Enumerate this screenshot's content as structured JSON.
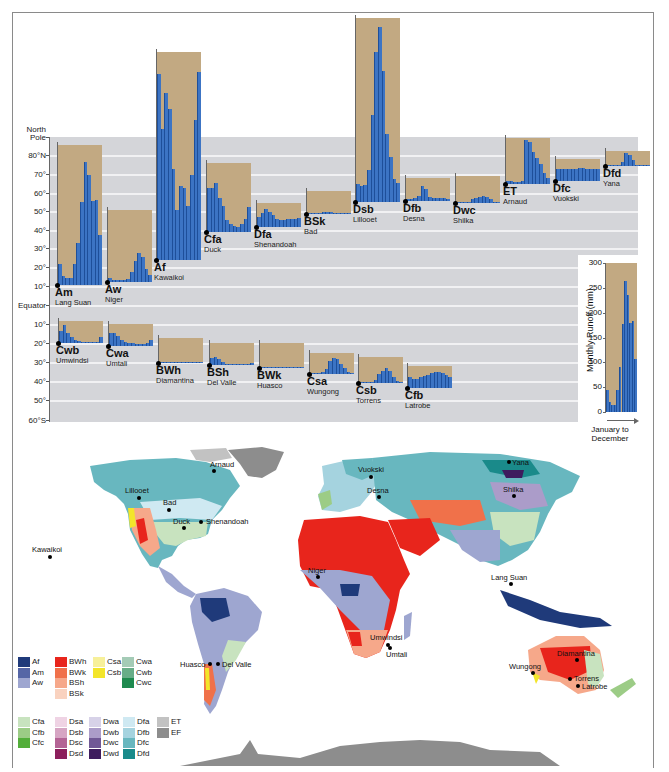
{
  "chart_data": {
    "type": "bar",
    "xlabel": "January to December",
    "ylabel": "Monthly Runoff (mm)",
    "ylim": [
      0,
      300
    ],
    "y_ticks": [
      0,
      50,
      100,
      150,
      200,
      250,
      300
    ],
    "latitude_axis": [
      "North Pole",
      "80°N",
      "70°",
      "60°",
      "50°",
      "40°",
      "30°",
      "20°",
      "10°",
      "Equator",
      "10°",
      "20°",
      "30°",
      "40°",
      "50°",
      "60°S"
    ],
    "categories": [
      "Jan",
      "Feb",
      "Mar",
      "Apr",
      "May",
      "Jun",
      "Jul",
      "Aug",
      "Sep",
      "Oct",
      "Nov",
      "Dec"
    ],
    "series": [
      {
        "name": "Am",
        "station": "Lang Suan",
        "values": [
          45,
          20,
          15,
          14,
          45,
          90,
          178,
          263,
          235,
          180,
          183,
          107
        ]
      },
      {
        "name": "Aw",
        "station": "Niger",
        "values": [
          8,
          5,
          4,
          4,
          4,
          6,
          22,
          46,
          62,
          54,
          28,
          15
        ]
      },
      {
        "name": "Af",
        "station": "Kawaikoi",
        "values": [
          398,
          280,
          357,
          323,
          195,
          107,
          158,
          154,
          116,
          182,
          300,
          402
        ]
      },
      {
        "name": "Cfa",
        "station": "Duck",
        "values": [
          94,
          94,
          105,
          73,
          56,
          26,
          17,
          13,
          11,
          17,
          28,
          54
        ]
      },
      {
        "name": "Dfa",
        "station": "Shenandoah",
        "values": [
          21,
          30,
          38,
          32,
          26,
          17,
          15,
          15,
          17,
          17,
          17,
          19
        ]
      },
      {
        "name": "BSk",
        "station": "Bad",
        "values": [
          1,
          1,
          1,
          2,
          4,
          4,
          4,
          3,
          2,
          1,
          1,
          1
        ]
      },
      {
        "name": "Dsb",
        "station": "Lillooet",
        "values": [
          38,
          35,
          37,
          68,
          186,
          322,
          375,
          280,
          145,
          97,
          50,
          40
        ]
      },
      {
        "name": "Dfb",
        "station": "Desna",
        "values": [
          4,
          4,
          6,
          11,
          32,
          26,
          9,
          6,
          6,
          6,
          6,
          4
        ]
      },
      {
        "name": "Dwc",
        "station": "Shilka",
        "values": [
          2,
          2,
          2,
          2,
          9,
          11,
          13,
          15,
          13,
          9,
          2,
          2
        ]
      },
      {
        "name": "ET",
        "station": "Arnaud",
        "values": [
          6,
          6,
          4,
          4,
          6,
          94,
          90,
          68,
          56,
          43,
          24,
          13
        ]
      },
      {
        "name": "Dfc",
        "station": "Vuokski",
        "values": [
          26,
          25,
          25,
          25,
          26,
          26,
          27,
          27,
          26,
          26,
          26,
          26
        ]
      },
      {
        "name": "Dfd",
        "station": "Yana",
        "values": [
          0,
          0,
          0,
          2,
          9,
          28,
          24,
          13,
          2,
          0,
          0,
          0
        ]
      },
      {
        "name": "Cwb",
        "station": "Umwindsi",
        "values": [
          26,
          39,
          21,
          13,
          6,
          4,
          2,
          2,
          2,
          2,
          2,
          13
        ]
      },
      {
        "name": "Cwa",
        "station": "Umtali",
        "values": [
          28,
          28,
          21,
          13,
          9,
          6,
          6,
          4,
          4,
          4,
          6,
          13
        ]
      },
      {
        "name": "BWh",
        "station": "Diamantina",
        "values": [
          0,
          2,
          2,
          2,
          1,
          0,
          0,
          0,
          0,
          0,
          0,
          0
        ]
      },
      {
        "name": "BSh",
        "station": "Del Valle",
        "values": [
          15,
          17,
          13,
          6,
          2,
          2,
          2,
          2,
          1,
          1,
          2,
          4
        ]
      },
      {
        "name": "BWk",
        "station": "Huasco",
        "values": [
          0,
          0,
          0,
          0,
          1,
          1,
          1,
          1,
          1,
          1,
          1,
          1
        ]
      },
      {
        "name": "Csa",
        "station": "Wungong",
        "values": [
          2,
          2,
          2,
          4,
          11,
          28,
          34,
          32,
          21,
          13,
          4,
          2
        ]
      },
      {
        "name": "Csb",
        "station": "Torrens",
        "values": [
          2,
          2,
          2,
          2,
          6,
          19,
          26,
          32,
          26,
          13,
          4,
          2
        ]
      },
      {
        "name": "Cfb",
        "station": "Latrobe",
        "values": [
          24,
          19,
          19,
          24,
          26,
          28,
          32,
          34,
          34,
          32,
          28,
          24
        ]
      }
    ],
    "legend_position": "bottom-left",
    "grid": true
  },
  "charts": [
    {
      "code": "Am",
      "station": "Lang Suan",
      "x": 58,
      "base": 285,
      "box": 300,
      "values": [
        45,
        20,
        15,
        14,
        45,
        90,
        178,
        263,
        235,
        180,
        183,
        107
      ]
    },
    {
      "code": "Aw",
      "station": "Niger",
      "x": 108,
      "base": 282,
      "box": 155,
      "values": [
        8,
        5,
        4,
        4,
        4,
        6,
        22,
        46,
        62,
        54,
        28,
        15
      ]
    },
    {
      "code": "Af",
      "station": "Kawaikoi",
      "x": 157,
      "base": 260,
      "box": 445,
      "values": [
        398,
        280,
        357,
        323,
        195,
        107,
        158,
        154,
        116,
        182,
        300,
        402
      ]
    },
    {
      "code": "Cfa",
      "station": "Duck",
      "x": 207,
      "base": 232,
      "box": 148,
      "values": [
        94,
        94,
        105,
        73,
        56,
        26,
        17,
        13,
        11,
        17,
        28,
        54
      ]
    },
    {
      "code": "Dfa",
      "station": "Shenandoah",
      "x": 257,
      "base": 227,
      "box": 51,
      "values": [
        21,
        30,
        38,
        32,
        26,
        17,
        15,
        15,
        17,
        17,
        17,
        19
      ]
    },
    {
      "code": "BSk",
      "station": "Bad",
      "x": 307,
      "base": 214,
      "box": 50,
      "values": [
        1,
        1,
        1,
        2,
        4,
        4,
        4,
        3,
        2,
        1,
        1,
        1
      ]
    },
    {
      "code": "Dsb",
      "station": "Lillooet",
      "x": 356,
      "base": 202,
      "box": 395,
      "values": [
        38,
        35,
        37,
        68,
        186,
        322,
        375,
        280,
        145,
        97,
        50,
        40
      ]
    },
    {
      "code": "Dfb",
      "station": "Desna",
      "x": 406,
      "base": 201,
      "box": 50,
      "values": [
        4,
        4,
        6,
        11,
        32,
        26,
        9,
        6,
        6,
        6,
        6,
        4
      ]
    },
    {
      "code": "Dwc",
      "station": "Shilka",
      "x": 456,
      "base": 203,
      "box": 58,
      "values": [
        2,
        2,
        2,
        2,
        9,
        11,
        13,
        15,
        13,
        9,
        2,
        2
      ]
    },
    {
      "code": "ET",
      "station": "Arnaud",
      "x": 506,
      "base": 184,
      "box": 98,
      "values": [
        6,
        6,
        4,
        4,
        6,
        94,
        90,
        68,
        56,
        43,
        24,
        13
      ]
    },
    {
      "code": "Dfc",
      "station": "Vuokski",
      "x": 556,
      "base": 181,
      "box": 47,
      "values": [
        26,
        25,
        25,
        25,
        26,
        26,
        27,
        27,
        26,
        26,
        26,
        26
      ]
    },
    {
      "code": "Dfd",
      "station": "Yana",
      "x": 606,
      "base": 166,
      "box": 32,
      "values": [
        0,
        0,
        0,
        2,
        9,
        28,
        24,
        13,
        2,
        0,
        0,
        0
      ]
    },
    {
      "code": "Cwb",
      "station": "Umwindsi",
      "x": 59,
      "base": 343,
      "box": 47,
      "values": [
        26,
        39,
        21,
        13,
        6,
        4,
        2,
        2,
        2,
        2,
        2,
        13
      ]
    },
    {
      "code": "Cwa",
      "station": "Umtali",
      "x": 109,
      "base": 346,
      "box": 47,
      "values": [
        28,
        28,
        21,
        13,
        9,
        6,
        6,
        4,
        4,
        4,
        6,
        13
      ]
    },
    {
      "code": "BWh",
      "station": "Diamantina",
      "x": 159,
      "base": 363,
      "box": 54,
      "values": [
        0,
        2,
        2,
        2,
        1,
        0,
        0,
        0,
        0,
        0,
        0,
        0
      ]
    },
    {
      "code": "BSh",
      "station": "Del Valle",
      "x": 210,
      "base": 365,
      "box": 47,
      "values": [
        15,
        17,
        13,
        6,
        2,
        2,
        2,
        2,
        1,
        1,
        2,
        4
      ]
    },
    {
      "code": "BWk",
      "station": "Huasco",
      "x": 260,
      "base": 368,
      "box": 54,
      "values": [
        0,
        0,
        0,
        0,
        1,
        1,
        1,
        1,
        1,
        1,
        1,
        1
      ]
    },
    {
      "code": "Csa",
      "station": "Wungong",
      "x": 310,
      "base": 374,
      "box": 45,
      "values": [
        2,
        2,
        2,
        4,
        11,
        28,
        34,
        32,
        21,
        13,
        4,
        2
      ]
    },
    {
      "code": "Csb",
      "station": "Torrens",
      "x": 359,
      "base": 383,
      "box": 56,
      "values": [
        2,
        2,
        2,
        2,
        6,
        19,
        26,
        32,
        26,
        13,
        4,
        2
      ]
    },
    {
      "code": "Cfb",
      "station": "Latrobe",
      "x": 408,
      "base": 388,
      "box": 47,
      "values": [
        24,
        19,
        19,
        24,
        26,
        28,
        32,
        34,
        34,
        32,
        28,
        24
      ]
    }
  ],
  "latitude": [
    {
      "label": "North",
      "y": 129
    },
    {
      "label": "Pole",
      "y": 137
    },
    {
      "label": "80°N",
      "y": 155
    },
    {
      "label": "70°",
      "y": 174
    },
    {
      "label": "60°",
      "y": 193
    },
    {
      "label": "50°",
      "y": 211
    },
    {
      "label": "40°",
      "y": 230
    },
    {
      "label": "30°",
      "y": 248
    },
    {
      "label": "20°",
      "y": 267
    },
    {
      "label": "10°",
      "y": 286
    },
    {
      "label": "Equator",
      "y": 305
    },
    {
      "label": "10°",
      "y": 324
    },
    {
      "label": "20°",
      "y": 343
    },
    {
      "label": "30°",
      "y": 362
    },
    {
      "label": "40°",
      "y": 381
    },
    {
      "label": "50°",
      "y": 400
    },
    {
      "label": "60°S",
      "y": 420
    }
  ],
  "scale": {
    "title": "Monthly Runoff (mm)",
    "ticks": [
      "300",
      "250",
      "200",
      "150",
      "100",
      "50",
      "0"
    ],
    "caption_line1": "January to",
    "caption_line2": "December",
    "values": [
      45,
      20,
      15,
      14,
      45,
      90,
      178,
      263,
      235,
      180,
      183,
      107
    ]
  },
  "legend": {
    "groups": [
      {
        "x": 18,
        "y": 657,
        "items": [
          {
            "label": "Af",
            "color": "#1f3a7a"
          },
          {
            "label": "Am",
            "color": "#5566a6"
          },
          {
            "label": "Aw",
            "color": "#9ea6d0"
          }
        ]
      },
      {
        "x": 55,
        "y": 657,
        "items": [
          {
            "label": "BWh",
            "color": "#e8251c"
          },
          {
            "label": "BWk",
            "color": "#f0714a"
          },
          {
            "label": "BSh",
            "color": "#f6a88a"
          },
          {
            "label": "BSk",
            "color": "#f9d2bf"
          }
        ]
      },
      {
        "x": 93,
        "y": 657,
        "items": [
          {
            "label": "Csa",
            "color": "#f7f09a"
          },
          {
            "label": "Csb",
            "color": "#f3e52a"
          }
        ]
      },
      {
        "x": 122,
        "y": 657,
        "items": [
          {
            "label": "Cwa",
            "color": "#a4cbb6"
          },
          {
            "label": "Cwb",
            "color": "#68ad88"
          },
          {
            "label": "Cwc",
            "color": "#1f8a4f"
          }
        ]
      },
      {
        "x": 18,
        "y": 717,
        "items": [
          {
            "label": "Cfa",
            "color": "#c8e3bf"
          },
          {
            "label": "Cfb",
            "color": "#9ccc86"
          },
          {
            "label": "Cfc",
            "color": "#53ae3a"
          }
        ]
      },
      {
        "x": 55,
        "y": 717,
        "items": [
          {
            "label": "Dsa",
            "color": "#efd3e4"
          },
          {
            "label": "Dsb",
            "color": "#d6a5c3"
          },
          {
            "label": "Dsc",
            "color": "#b46495"
          },
          {
            "label": "Dsd",
            "color": "#8c1f5c"
          }
        ]
      },
      {
        "x": 89,
        "y": 717,
        "items": [
          {
            "label": "Dwa",
            "color": "#d7d2e8"
          },
          {
            "label": "Dwb",
            "color": "#ab9cc9"
          },
          {
            "label": "Dwc",
            "color": "#705896"
          },
          {
            "label": "Dwd",
            "color": "#3e1c5e"
          }
        ]
      },
      {
        "x": 123,
        "y": 717,
        "items": [
          {
            "label": "Dfa",
            "color": "#cfe9f2"
          },
          {
            "label": "Dfb",
            "color": "#a5d3df"
          },
          {
            "label": "Dfc",
            "color": "#68b7bf"
          },
          {
            "label": "Dfd",
            "color": "#1a8a8a"
          }
        ]
      },
      {
        "x": 157,
        "y": 717,
        "items": [
          {
            "label": "ET",
            "color": "#c2c2c2"
          },
          {
            "label": "EF",
            "color": "#8d8d8d"
          }
        ]
      }
    ]
  },
  "map_places": [
    {
      "name": "Arnaud",
      "x": 214,
      "y": 471,
      "dx": -4,
      "dy": -11
    },
    {
      "name": "Lillooet",
      "x": 139,
      "y": 498,
      "dx": -14,
      "dy": -12
    },
    {
      "name": "Bad",
      "x": 169,
      "y": 510,
      "dx": -6,
      "dy": -12
    },
    {
      "name": "Duck",
      "x": 184,
      "y": 528,
      "dx": -11,
      "dy": -11
    },
    {
      "name": "Shenandoah",
      "x": 201,
      "y": 522,
      "dx": 5,
      "dy": -5
    },
    {
      "name": "Kawaikoi",
      "x": 50,
      "y": 557,
      "dx": -18,
      "dy": -12
    },
    {
      "name": "Vuokski",
      "x": 371,
      "y": 477,
      "dx": -13,
      "dy": -12
    },
    {
      "name": "Desna",
      "x": 379,
      "y": 497,
      "dx": -12,
      "dy": -11
    },
    {
      "name": "Yana",
      "x": 509,
      "y": 462,
      "dx": 3,
      "dy": -4
    },
    {
      "name": "Shilka",
      "x": 514,
      "y": 496,
      "dx": -11,
      "dy": -11
    },
    {
      "name": "Niger",
      "x": 318,
      "y": 577,
      "dx": -10,
      "dy": -11
    },
    {
      "name": "Lang Suan",
      "x": 511,
      "y": 584,
      "dx": -20,
      "dy": -11
    },
    {
      "name": "Umwindsi",
      "x": 388,
      "y": 645,
      "dx": -18,
      "dy": -12
    },
    {
      "name": "Umtali",
      "x": 390,
      "y": 648,
      "dx": -4,
      "dy": 2
    },
    {
      "name": "Huasco",
      "x": 210,
      "y": 664,
      "dx": -30,
      "dy": -4
    },
    {
      "name": "Del Valle",
      "x": 218,
      "y": 664,
      "dx": 4,
      "dy": -4
    },
    {
      "name": "Diamantina",
      "x": 577,
      "y": 660,
      "dx": -20,
      "dy": -11
    },
    {
      "name": "Wungong",
      "x": 533,
      "y": 673,
      "dx": -24,
      "dy": -11
    },
    {
      "name": "Torrens",
      "x": 570,
      "y": 679,
      "dx": 4,
      "dy": -5
    },
    {
      "name": "Latrobe",
      "x": 578,
      "y": 686,
      "dx": 4,
      "dy": -4
    }
  ]
}
